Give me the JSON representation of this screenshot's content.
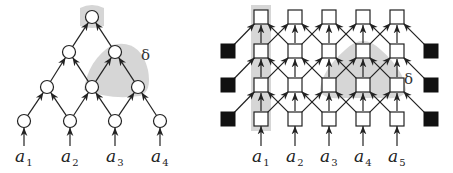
{
  "left_diagram": {
    "title": "tree network",
    "delta_label": "δ",
    "inputs": [
      {
        "base": "a",
        "sub": "1"
      },
      {
        "base": "a",
        "sub": "2"
      },
      {
        "base": "a",
        "sub": "3"
      },
      {
        "base": "a",
        "sub": "4"
      }
    ],
    "levels": 4,
    "node_shape": "circle"
  },
  "right_diagram": {
    "title": "grid network",
    "delta_label": "δ",
    "inputs": [
      {
        "base": "a",
        "sub": "1"
      },
      {
        "base": "a",
        "sub": "2"
      },
      {
        "base": "a",
        "sub": "3"
      },
      {
        "base": "a",
        "sub": "4"
      },
      {
        "base": "a",
        "sub": "5"
      }
    ],
    "rows": 4,
    "columns": 5,
    "boundary_nodes": "filled-square",
    "node_shape": "square"
  },
  "colors": {
    "shade": "#d6d6d6",
    "stroke": "#222222",
    "boundary_fill": "#111111"
  }
}
